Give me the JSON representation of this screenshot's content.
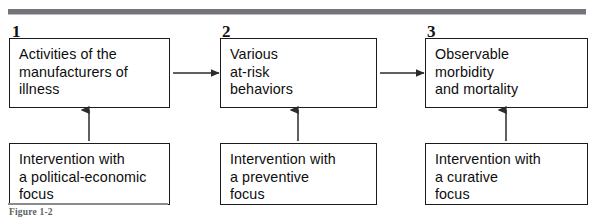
{
  "figure": {
    "caption": "Figure 1-2",
    "top_rule_color": "#73757a",
    "box_border_color": "#1b1b1b",
    "arrow_color": "#2b2b2b"
  },
  "steps": [
    {
      "number": "1",
      "process_box": "Activities of the\nmanufacturers of\nillness",
      "intervention_box": "Intervention with\na political-economic\nfocus"
    },
    {
      "number": "2",
      "process_box": "Various\nat-risk\nbehaviors",
      "intervention_box": "Intervention with\na preventive\nfocus"
    },
    {
      "number": "3",
      "process_box": "Observable\nmorbidity\nand mortality",
      "intervention_box": "Intervention with\na curative\nfocus"
    }
  ],
  "arrows": {
    "horizontal": [
      "step-1-to-step-2",
      "step-2-to-step-3"
    ],
    "vertical": [
      "intervention-1-to-process-1",
      "intervention-2-to-process-2",
      "intervention-3-to-process-3"
    ]
  }
}
